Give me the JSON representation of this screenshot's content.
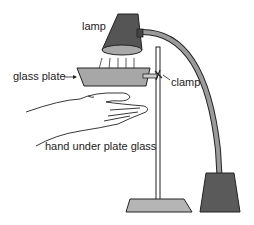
{
  "diagram": {
    "labels": {
      "lamp": "lamp",
      "glass_plate": "glass plate",
      "clamp": "clamp",
      "hand": "hand under plate glass"
    },
    "colors": {
      "lamp_shade": "#555555",
      "lamp_rim": "#a9a9a9",
      "arm": "#9b9b9b",
      "glass_plate": "#a7a7a7",
      "stand_base": "#b5b5b5",
      "lamp_base": "#5a5a5a",
      "outline": "#222222"
    }
  }
}
